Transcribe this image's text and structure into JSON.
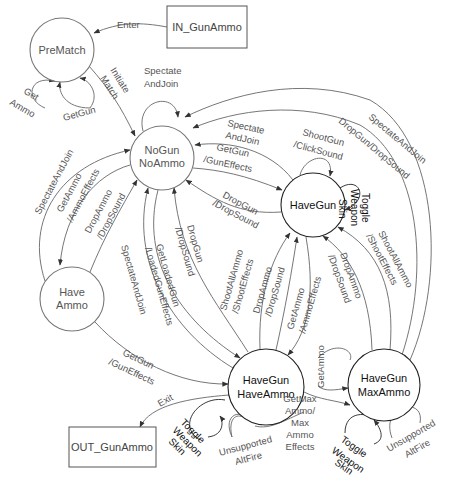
{
  "diagram": {
    "colors": {
      "background": "#ffffff",
      "state_stroke": "#222222",
      "edge_stroke": "#666666",
      "label_text": "#555555",
      "emphasis_text": "#111111"
    },
    "terminals": {
      "in": {
        "label": "IN_GunAmmo",
        "x": 167,
        "y": 6,
        "w": 80,
        "h": 42
      },
      "out": {
        "label": "OUT_GunAmmo",
        "x": 69,
        "y": 427,
        "w": 87,
        "h": 40
      }
    },
    "states": {
      "prematch": {
        "lines": [
          "PreMatch"
        ],
        "cx": 62,
        "cy": 50,
        "r": 32,
        "light": true
      },
      "nogun_noammo": {
        "lines": [
          "NoGun",
          "NoAmmo"
        ],
        "cx": 162,
        "cy": 158,
        "r": 32,
        "light": true
      },
      "havegun": {
        "lines": [
          "HaveGun"
        ],
        "cx": 313,
        "cy": 205,
        "r": 32,
        "light": false
      },
      "have_ammo": {
        "lines": [
          "Have",
          "Ammo"
        ],
        "cx": 72,
        "cy": 299,
        "r": 32,
        "light": true
      },
      "havegun_haveammo": {
        "lines": [
          "HaveGun",
          "HaveAmmo"
        ],
        "cx": 266,
        "cy": 387,
        "r": 38,
        "light": false
      },
      "havegun_maxammo": {
        "lines": [
          "HaveGun",
          "MaxAmmo"
        ],
        "cx": 384,
        "cy": 385,
        "r": 36,
        "light": false
      }
    },
    "transitions": {
      "enter": "Enter",
      "initiate_match": [
        "Initiate",
        "Match"
      ],
      "prematch_get_ammo": [
        "Get",
        "Ammo"
      ],
      "prematch_getgun": "GetGun",
      "nogun_spectate_self": [
        "Spectate",
        "AndJoin"
      ],
      "havegun_spectate_to_nogun": [
        "Spectate",
        "AndJoin"
      ],
      "nogun_getgun": [
        "GetGun",
        "/GunEffects"
      ],
      "havegun_shootgun": [
        "ShootGun",
        "/ClickSound"
      ],
      "havegun_toggle_skin": [
        "Toggle",
        "Weapon",
        "Skin"
      ],
      "havegun_dropgun": [
        "DropGun",
        "/DropSound"
      ],
      "maxammo_dropgun_to_nogun": "DropGun/DropSound",
      "maxammo_spectate_to_nogun": "SpectateAndJoin",
      "haveammo_spectate_to_nogun": "SpectateAndJoin",
      "nogun_getammo": [
        "GetAmmo",
        "/AmmoEffects"
      ],
      "haveammo_dropammo": [
        "DropAmmo",
        "/DropSound"
      ],
      "haveboth_spectate_to_nogun": "SpectateAndJoin",
      "nogun_getloadedgun": [
        "GetLoadedGun",
        "/LoadedGunEffects"
      ],
      "haveboth_dropgun": [
        "DropGun",
        "/DropSound"
      ],
      "haveboth_shootallammo": [
        "ShootAllAmmo",
        "/ShootEffects"
      ],
      "haveboth_dropammo": [
        "DropAmmo",
        "/DropSound"
      ],
      "havegun_getammo": [
        "GetAmmo",
        "/AmmoEffects"
      ],
      "maxammo_dropammo": [
        "DropAmmo",
        "/DropSound"
      ],
      "maxammo_shootallammo": [
        "ShootAllAmmo",
        "/ShootEffects"
      ],
      "haveammo_getgun": [
        "GetGun",
        "/GunEffects"
      ],
      "exit": "Exit",
      "haveboth_toggle_skin": [
        "Toggle",
        "Weapon",
        "Skin"
      ],
      "haveboth_unsupported": [
        "Unsupported",
        "AltFire"
      ],
      "haveboth_getmaxammo": [
        "GetMax",
        "Ammo/",
        "Max",
        "Ammo",
        "Effects"
      ],
      "maxammo_getammo": "GetAmmo",
      "maxammo_toggle_skin": [
        "Toggle",
        "Weapon",
        "Skin"
      ],
      "maxammo_unsupported": [
        "Unsupported",
        "AltFire"
      ]
    }
  }
}
